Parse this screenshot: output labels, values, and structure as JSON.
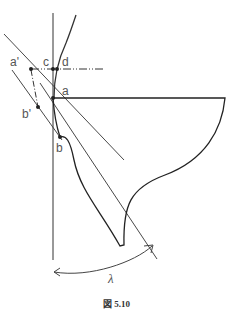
{
  "figure": {
    "caption": "図 5.10",
    "labels": {
      "a_prime": "a'",
      "b_prime": "b'",
      "c": "c",
      "d": "d",
      "a": "a",
      "b": "b",
      "lambda": "λ"
    }
  }
}
